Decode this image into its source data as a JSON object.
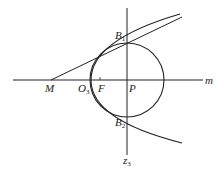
{
  "diagram": {
    "type": "geometry",
    "labels": {
      "B1": {
        "main": "B",
        "sub": "1"
      },
      "B2": {
        "main": "B",
        "sub": "2"
      },
      "M": {
        "main": "M"
      },
      "O3": {
        "main": "O",
        "sub": "3"
      },
      "F": {
        "main": "F"
      },
      "P": {
        "main": "P"
      },
      "m": {
        "main": "m"
      },
      "z3": {
        "main": "z",
        "sub": "3"
      }
    },
    "stroke_color": "#222222",
    "background_color": "#ffffff"
  }
}
